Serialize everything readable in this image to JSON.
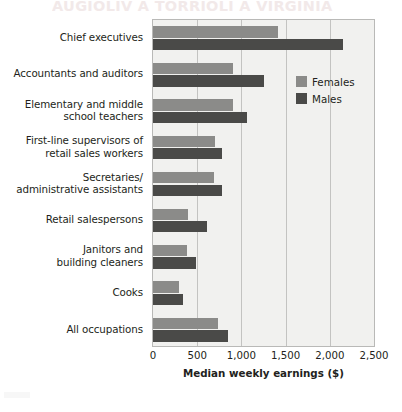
{
  "bleed_through_text": "AUGIOLIV A TORRIOLI A VIRGINIA",
  "legend": {
    "position": "inside-right",
    "entries": [
      {
        "label": "Females",
        "color": "#8b8b89"
      },
      {
        "label": "Males",
        "color": "#4a4a48"
      }
    ]
  },
  "axis": {
    "x_title": "Median weekly earnings ($)",
    "x_ticks": [
      "0",
      "500",
      "1,000",
      "1,500",
      "2,000",
      "2,500"
    ]
  },
  "chart_data": {
    "type": "bar",
    "orientation": "horizontal",
    "title": "",
    "xlabel": "Median weekly earnings ($)",
    "ylabel": "",
    "xlim": [
      0,
      2500
    ],
    "xticks": [
      0,
      500,
      1000,
      1500,
      2000,
      2500
    ],
    "xticklabels": [
      "0",
      "500",
      "1,000",
      "1,500",
      "2,000",
      "2,500"
    ],
    "grid": "vertical",
    "legend_position": "inside-right",
    "categories": [
      "Chief executives",
      "Accountants and auditors",
      "Elementary and middle school teachers",
      "First-line supervisors of retail sales workers",
      "Secretaries/administrative assistants",
      "Retail salespersons",
      "Janitors and building cleaners",
      "Cooks",
      "All occupations"
    ],
    "category_label_lines": [
      [
        "Chief executives"
      ],
      [
        "Accountants and auditors"
      ],
      [
        "Elementary and middle",
        "school teachers"
      ],
      [
        "First-line supervisors of",
        "retail sales workers"
      ],
      [
        "Secretaries/",
        "administrative assistants"
      ],
      [
        "Retail salespersons"
      ],
      [
        "Janitors and",
        "building cleaners"
      ],
      [
        "Cooks"
      ],
      [
        "All occupations"
      ]
    ],
    "series": [
      {
        "name": "Females",
        "color": "#8b8b89",
        "values": [
          1410,
          900,
          900,
          700,
          690,
          400,
          380,
          290,
          730
        ]
      },
      {
        "name": "Males",
        "color": "#4a4a48",
        "values": [
          2150,
          1260,
          1060,
          780,
          780,
          610,
          490,
          340,
          850
        ]
      }
    ]
  }
}
